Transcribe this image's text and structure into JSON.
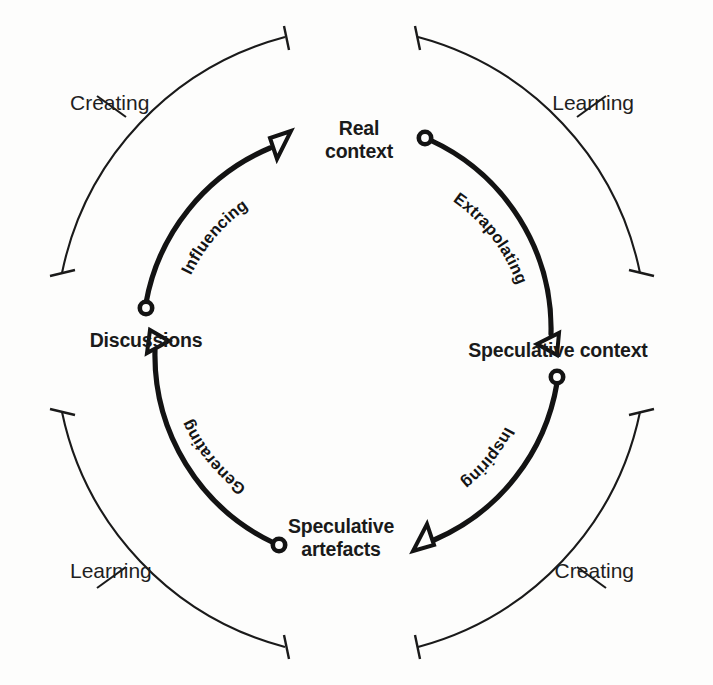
{
  "diagram": {
    "type": "circular-process-diagram",
    "background_color": "#fdfdfc",
    "ink_color": "#1a1a1a",
    "center": {
      "x": 351,
      "y": 342
    },
    "outer_arc_radius": 308,
    "inner_arc_radius": 208,
    "nodes": [
      {
        "id": "real-context",
        "label": "Real context",
        "line1": "Real",
        "line2": "context",
        "angle_deg": -90,
        "x": 351,
        "y": 142
      },
      {
        "id": "speculative-context",
        "label": "Speculative context",
        "line1": "Speculative",
        "line2": "context",
        "angle_deg": 0,
        "x": 551,
        "y": 352
      },
      {
        "id": "speculative-artefacts",
        "label": "Speculative artefacts",
        "line1": "Speculative",
        "line2": "artefacts",
        "angle_deg": 90,
        "x": 351,
        "y": 542
      },
      {
        "id": "discussions",
        "label": "Discussions",
        "line1": "Discussions",
        "line2": "",
        "angle_deg": 180,
        "x": 151,
        "y": 340
      }
    ],
    "transitions": [
      {
        "id": "extrapolating",
        "label": "Extrapolating",
        "from": "real-context",
        "to": "speculative-context",
        "quadrant": "top-right"
      },
      {
        "id": "inspiring",
        "label": "Inspiring",
        "from": "speculative-context",
        "to": "speculative-artefacts",
        "quadrant": "bottom-right"
      },
      {
        "id": "generating",
        "label": "Generating",
        "from": "speculative-artefacts",
        "to": "discussions",
        "quadrant": "bottom-left"
      },
      {
        "id": "influencing",
        "label": "Influencing",
        "from": "discussions",
        "to": "real-context",
        "quadrant": "top-left"
      }
    ],
    "outer_phases": [
      {
        "id": "outer-creating-top-left",
        "label": "Creating",
        "quadrant": "top-left",
        "x": 70,
        "y": 110
      },
      {
        "id": "outer-learning-top-right",
        "label": "Learning",
        "quadrant": "top-right",
        "x": 634,
        "y": 110
      },
      {
        "id": "outer-learning-bottom-left",
        "label": "Learning",
        "quadrant": "bottom-left",
        "x": 70,
        "y": 578
      },
      {
        "id": "outer-creating-bottom-right",
        "label": "Creating",
        "quadrant": "bottom-right",
        "x": 634,
        "y": 578
      }
    ]
  }
}
